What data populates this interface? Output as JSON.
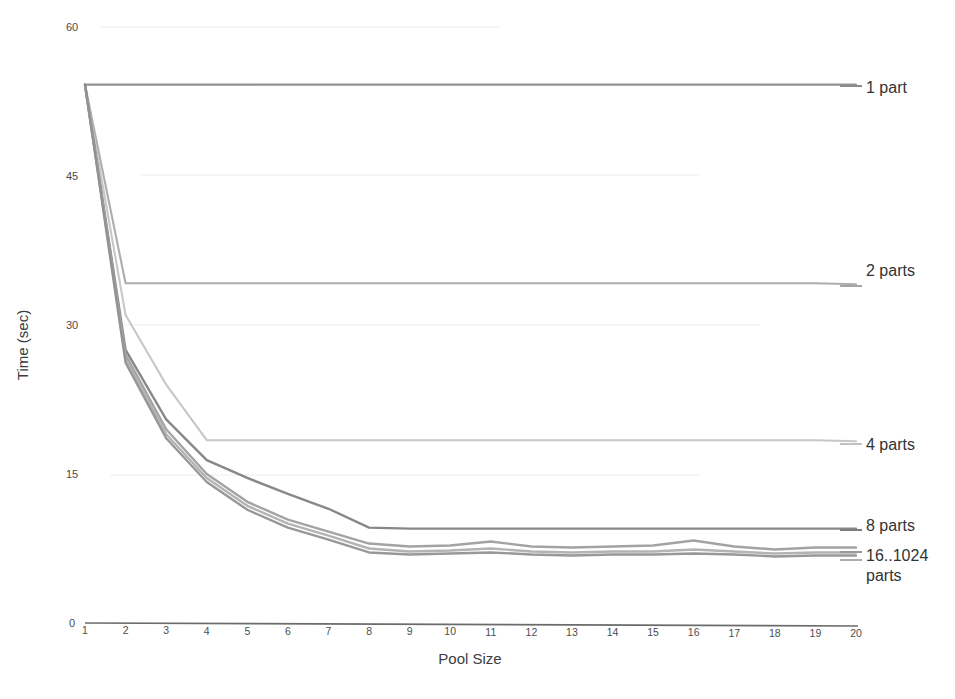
{
  "chart_data": {
    "type": "line",
    "title": "",
    "xlabel": "Pool Size",
    "ylabel": "Time (sec)",
    "x": [
      1,
      2,
      3,
      4,
      5,
      6,
      7,
      8,
      9,
      10,
      11,
      12,
      13,
      14,
      15,
      16,
      17,
      18,
      19,
      20
    ],
    "xlim": [
      1,
      20
    ],
    "ylim": [
      0,
      60
    ],
    "yticks": [
      0,
      15,
      30,
      45,
      60
    ],
    "xticks": [
      1,
      2,
      3,
      4,
      5,
      6,
      7,
      8,
      9,
      10,
      11,
      12,
      13,
      14,
      15,
      16,
      17,
      18,
      19,
      20
    ],
    "grid": false,
    "legend_position": "right-inline",
    "series": [
      {
        "name": "1 part",
        "color": "#8a8a8a",
        "values": [
          54.2,
          54.2,
          54.2,
          54.2,
          54.2,
          54.2,
          54.2,
          54.2,
          54.2,
          54.2,
          54.2,
          54.2,
          54.2,
          54.2,
          54.2,
          54.2,
          54.2,
          54.2,
          54.2,
          54.2
        ]
      },
      {
        "name": "2 parts",
        "color": "#a6a6a6",
        "values": [
          54.2,
          34.2,
          34.2,
          34.2,
          34.2,
          34.2,
          34.2,
          34.2,
          34.2,
          34.2,
          34.2,
          34.2,
          34.2,
          34.2,
          34.2,
          34.2,
          34.2,
          34.2,
          34.2,
          34.1
        ]
      },
      {
        "name": "4 parts",
        "color": "#c2c2c2",
        "values": [
          54.2,
          31.0,
          24.0,
          18.4,
          18.4,
          18.4,
          18.4,
          18.4,
          18.4,
          18.4,
          18.4,
          18.4,
          18.4,
          18.4,
          18.4,
          18.4,
          18.4,
          18.4,
          18.4,
          18.3
        ]
      },
      {
        "name": "8 parts",
        "color": "#7e7e7e",
        "values": [
          54.2,
          27.5,
          20.5,
          16.4,
          14.6,
          13.0,
          11.5,
          9.6,
          9.5,
          9.5,
          9.5,
          9.5,
          9.5,
          9.5,
          9.5,
          9.5,
          9.5,
          9.5,
          9.5,
          9.5
        ]
      },
      {
        "name": "16..1024 parts",
        "color": "#9b9b9b",
        "values": [
          54.2,
          27.0,
          19.5,
          15.0,
          12.2,
          10.4,
          9.2,
          8.0,
          7.7,
          7.8,
          8.2,
          7.7,
          7.6,
          7.7,
          7.8,
          8.3,
          7.7,
          7.4,
          7.6,
          7.6
        ]
      },
      {
        "name": "16..1024 parts b",
        "color": "#adadad",
        "values": [
          54.2,
          26.6,
          19.0,
          14.6,
          11.8,
          10.0,
          8.8,
          7.5,
          7.2,
          7.3,
          7.5,
          7.2,
          7.1,
          7.2,
          7.2,
          7.4,
          7.2,
          7.0,
          7.1,
          7.1
        ]
      },
      {
        "name": "16..1024 parts c",
        "color": "#8f8f8f",
        "values": [
          54.2,
          26.2,
          18.6,
          14.2,
          11.4,
          9.6,
          8.4,
          7.1,
          6.9,
          7.0,
          7.1,
          6.9,
          6.8,
          6.9,
          6.9,
          7.0,
          6.9,
          6.7,
          6.8,
          6.8
        ]
      }
    ],
    "legend_entries": [
      {
        "label": "1 part",
        "y_value": 54.2
      },
      {
        "label": "2 parts",
        "y_value": 34.2
      },
      {
        "label": "4 parts",
        "y_value": 18.4
      },
      {
        "label": "8 parts",
        "y_value": 9.5
      },
      {
        "label": "16..1024",
        "y_value": 7.3
      },
      {
        "label": "parts",
        "y_value": 5.9
      }
    ]
  },
  "axes": {
    "y_title": "Time (sec)",
    "x_title": "Pool Size",
    "y_tick_labels": [
      "60",
      "45",
      "30",
      "15",
      "0"
    ],
    "x_tick_labels": [
      "1",
      "2",
      "3",
      "4",
      "5",
      "6",
      "7",
      "8",
      "9",
      "10",
      "11",
      "12",
      "13",
      "14",
      "15",
      "16",
      "17",
      "18",
      "19",
      "20"
    ]
  },
  "legend": {
    "label_1part": "1 part",
    "label_2parts": "2 parts",
    "label_4parts": "4 parts",
    "label_8parts": "8 parts",
    "label_16to1024_line1": "16..1024",
    "label_16to1024_line2": "parts"
  },
  "colors": {
    "axis": "#6b6b6b",
    "text": "#3a3a3a",
    "background": "#ffffff"
  }
}
